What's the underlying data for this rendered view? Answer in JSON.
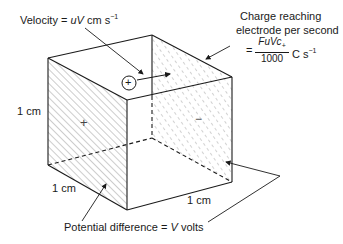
{
  "labels": {
    "velocity_prefix": "Velocity = ",
    "velocity_var": "uV",
    "velocity_unit": " cm s",
    "velocity_exp": "−1",
    "charge_line1": "Charge reaching",
    "charge_line2": "electrode per second",
    "charge_eq": "=",
    "charge_num": "FuVc",
    "charge_num_sub": "+",
    "charge_den": "1000",
    "charge_unit": "C s",
    "charge_exp": "−1",
    "side_left": "1 cm",
    "side_bottom_left": "1 cm",
    "side_bottom_right": "1 cm",
    "potential_prefix": "Potential difference = ",
    "potential_var": "V",
    "potential_unit": " volts",
    "plus_face": "+",
    "minus_face": "−",
    "ion": "+"
  },
  "colors": {
    "line": "#1a1a1a",
    "hatch": "#555555",
    "background": "#ffffff"
  }
}
